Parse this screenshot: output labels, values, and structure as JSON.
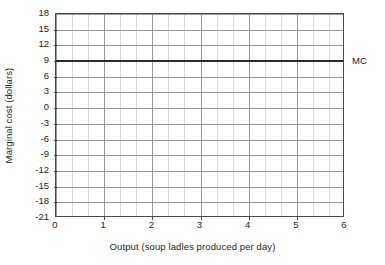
{
  "chart_data": {
    "type": "line",
    "title": "",
    "xlabel": "Output (soup ladles produced per day)",
    "ylabel": "Marginal cost (dollars)",
    "xlim": [
      0,
      6
    ],
    "ylim": [
      -21,
      18
    ],
    "xticks": [
      0,
      1,
      2,
      3,
      4,
      5,
      6
    ],
    "yticks": [
      18,
      15,
      12,
      9,
      6,
      3,
      0,
      -3,
      -6,
      -9,
      -12,
      -15,
      -18,
      -21
    ],
    "xtick_labels": [
      "0",
      "1",
      "2",
      "3",
      "4",
      "5",
      "6"
    ],
    "ytick_labels": [
      "18",
      "15",
      "12",
      "9",
      "6",
      "3",
      "0",
      "-3",
      "-6",
      "-9",
      "-12",
      "-15",
      "-18",
      "-21"
    ],
    "grid": true,
    "minor_grid": true,
    "x_minor_divisions_per_unit": 3,
    "legend_position": "right-of-axis",
    "series": [
      {
        "name": "MC",
        "label": "MC",
        "kind": "horizontal-line",
        "constant_value": 9,
        "x": [
          0,
          1,
          2,
          3,
          4,
          5,
          6
        ],
        "values": [
          9,
          9,
          9,
          9,
          9,
          9,
          9
        ],
        "color": "#2b2b2b"
      }
    ],
    "annotations": [
      {
        "text": "MC",
        "x": 6,
        "y": 9,
        "placement": "outside-right"
      }
    ]
  },
  "colors": {
    "background": "#ffffff",
    "axis": "#4a4a4a",
    "grid_major": "#9a9a9a",
    "grid_minor": "#d8d8d8",
    "series_mc": "#2b2b2b",
    "text": "#231f20"
  }
}
